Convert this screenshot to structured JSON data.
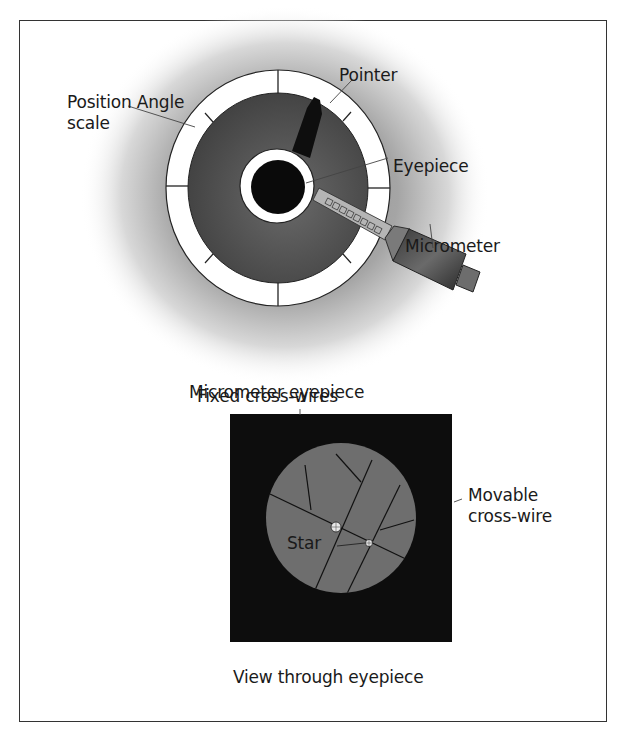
{
  "figure": {
    "top_diagram": {
      "title": "Micrometer eyepiece",
      "labels": {
        "position_angle_scale": [
          "Position Angle",
          "scale"
        ],
        "pointer": "Pointer",
        "eyepiece": "Eyepiece",
        "micrometer": "Micrometer"
      },
      "scale_ticks": 12
    },
    "bottom_diagram": {
      "title": "View through eyepiece",
      "labels": {
        "fixed_cross_wires": "Fixed cross-wires",
        "movable_cross_wire": [
          "Movable",
          "cross-wire"
        ],
        "star": "Star"
      }
    },
    "colors": {
      "frame": "#333333",
      "dial_ring": "#ffffff",
      "dial_disc": "#4d4d4d",
      "eyepiece_black": "#0a0a0a",
      "view_background": "#0d0d0d",
      "view_field": "#6e6e6e",
      "halo": "#9a9a9a"
    }
  }
}
